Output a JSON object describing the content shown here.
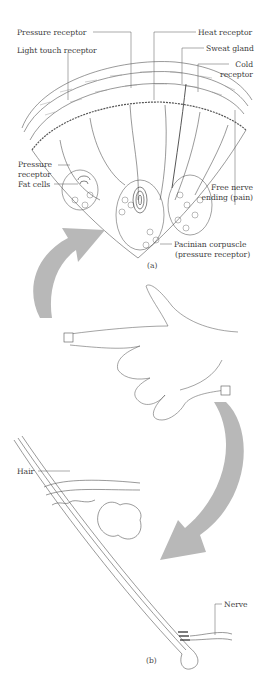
{
  "figure": {
    "panel_a": {
      "caption": "(a)",
      "subject": "skin cross-section",
      "labels": {
        "pressure_receptor_top": "Pressure receptor",
        "light_touch_receptor": "Light touch receptor",
        "heat_receptor": "Heat receptor",
        "sweat_gland": "Sweat gland",
        "cold_receptor_1": "Cold",
        "cold_receptor_2": "receptor",
        "pressure_receptor_side_1": "Pressure",
        "pressure_receptor_side_2": "receptor",
        "fat_cells": "Fat cells",
        "free_nerve_1": "Free nerve",
        "free_nerve_2": "ending (pain)",
        "pacinian_1": "Pacinian corpuscle",
        "pacinian_2": "(pressure receptor)"
      }
    },
    "middle": {
      "subject": "hand pointing with two magnified areas"
    },
    "panel_b": {
      "caption": "(b)",
      "subject": "hair follicle",
      "labels": {
        "hair": "Hair",
        "nerve": "Nerve"
      }
    },
    "colors": {
      "arrow": "#b8b8b8",
      "line": "#555555"
    }
  }
}
